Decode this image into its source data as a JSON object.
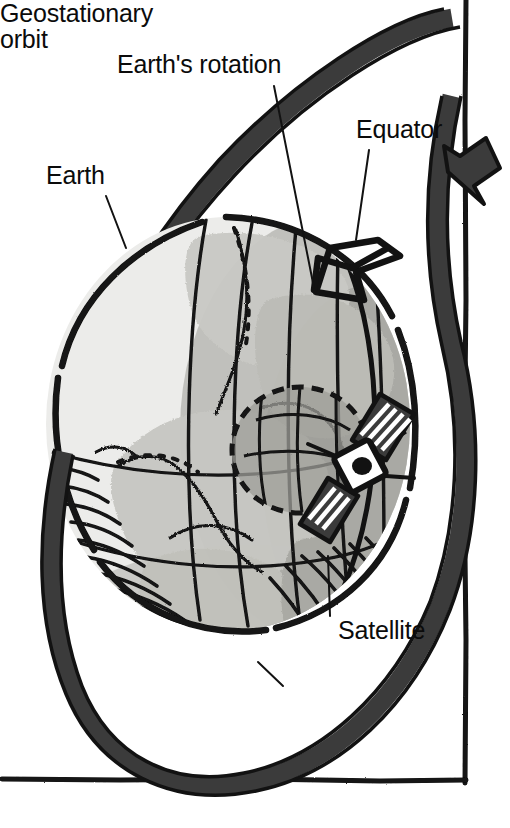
{
  "figure": {
    "type": "hand-drawn-diagram",
    "background_color": "#ffffff",
    "ink_color": "#121212",
    "orbit_band_color": "#3b3b3b",
    "globe_light_color": "#e8e8e6",
    "globe_land_color": "#c2c2bd",
    "globe_shadow_color": "#a6a6a2",
    "globe_dark_color": "#8f8f8b",
    "footprint_fill": "#9a9a96"
  },
  "labels": {
    "earth": "Earth",
    "rotation": "Earth's rotation",
    "equator": "Equator",
    "satellite": "Satellite",
    "geostationary_orbit_line1": "Geostationary",
    "geostationary_orbit_line2": "orbit"
  },
  "elements": {
    "globe_name": "earth-globe",
    "orbit_name": "geostationary-orbit-band",
    "orbit_arrow_name": "orbit-direction-arrow",
    "rotation_arrow_name": "earth-rotation-arrow",
    "equator_band_name": "equator-band",
    "satellite_name": "satellite-body",
    "footprint_name": "satellite-coverage-footprint",
    "frame_name": "page-frame-border"
  }
}
